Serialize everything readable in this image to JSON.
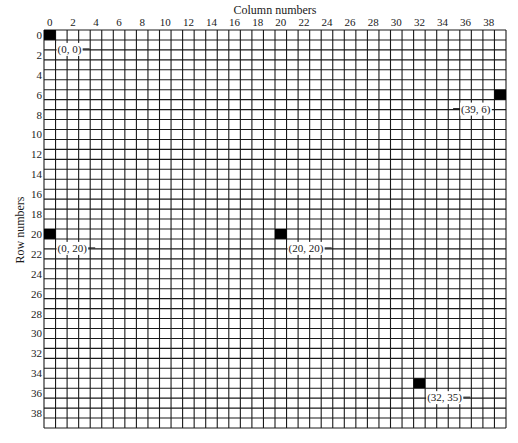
{
  "diagram": {
    "column_axis_title": "Column numbers",
    "row_axis_title": "Row numbers",
    "grid": {
      "columns": 40,
      "rows": 40
    },
    "column_tick_values": [
      0,
      2,
      4,
      6,
      8,
      10,
      12,
      14,
      16,
      18,
      20,
      22,
      24,
      26,
      28,
      30,
      32,
      34,
      36,
      38
    ],
    "row_tick_values": [
      0,
      2,
      4,
      6,
      8,
      10,
      12,
      14,
      16,
      18,
      20,
      22,
      24,
      26,
      28,
      30,
      32,
      34,
      36,
      38
    ],
    "highlighted_cells": [
      {
        "col": 0,
        "row": 0,
        "label": "(0, 0)"
      },
      {
        "col": 39,
        "row": 6,
        "label": "(39, 6)"
      },
      {
        "col": 0,
        "row": 20,
        "label": "(0, 20)"
      },
      {
        "col": 20,
        "row": 20,
        "label": "(20, 20)"
      },
      {
        "col": 32,
        "row": 35,
        "label": "(32, 35)"
      }
    ],
    "colors": {
      "grid_line": "#1a1a1a",
      "filled_cell": "#000000",
      "background": "#ffffff"
    }
  }
}
